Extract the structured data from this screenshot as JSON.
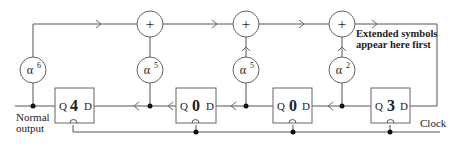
{
  "diagram": {
    "title": "",
    "multipliers": [
      {
        "base": "α",
        "exp": "6"
      },
      {
        "base": "α",
        "exp": "5"
      },
      {
        "base": "α",
        "exp": "5"
      },
      {
        "base": "α",
        "exp": "2"
      }
    ],
    "adders": [
      {
        "symbol": "+"
      },
      {
        "symbol": "+"
      },
      {
        "symbol": "+"
      }
    ],
    "registers": [
      {
        "q": "Q",
        "value": "4",
        "d": "D"
      },
      {
        "q": "Q",
        "value": "0",
        "d": "D"
      },
      {
        "q": "Q",
        "value": "0",
        "d": "D"
      },
      {
        "q": "Q",
        "value": "3",
        "d": "D"
      }
    ],
    "labels": {
      "normal_output_line1": "Normal",
      "normal_output_line2": "output",
      "extended_line1": "Extended symbols",
      "extended_line2": "appear here first",
      "clock": "Clock"
    }
  }
}
